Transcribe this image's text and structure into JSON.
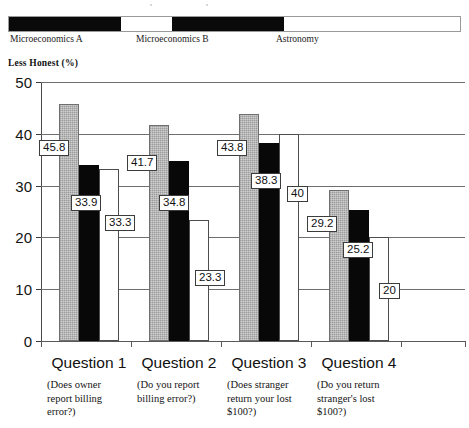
{
  "legend": {
    "items": [
      {
        "label": "Microeconomics A",
        "color": "#0a0a0a",
        "swatch_left": 0,
        "swatch_width": 112,
        "label_left": 2
      },
      {
        "label": "Microeconomics B",
        "color": "#0a0a0a",
        "swatch_left": 163,
        "swatch_width": 112,
        "label_left": 128
      },
      {
        "label": "Astronomy",
        "color": "#ffffff",
        "swatch_left": 275,
        "swatch_width": 0,
        "label_left": 268
      }
    ]
  },
  "axis_title": "Less Honest (%)",
  "chart_data": {
    "type": "bar",
    "title": "",
    "xlabel": "",
    "ylabel": "Less Honest (%)",
    "ylim": [
      0,
      50
    ],
    "yticks": [
      0,
      10,
      20,
      30,
      40,
      50
    ],
    "ytick_labels": [
      "0",
      "10",
      "20",
      "30",
      "40",
      "50"
    ],
    "grid": true,
    "legend_position": "top",
    "categories": [
      "Question 1",
      "Question 2",
      "Question 3",
      "Question 4"
    ],
    "category_sublabels": [
      "(Does owner report billing error?)",
      "(Do you report billing error?)",
      "(Does stranger return your lost $100?)",
      "(Do you return stranger's lost $100?)"
    ],
    "series": [
      {
        "name": "Microeconomics A",
        "color": "#adadad",
        "values": [
          45.8,
          41.7,
          43.8,
          29.2
        ],
        "labels": [
          "45.8",
          "41.7",
          "43.8",
          "29.2"
        ]
      },
      {
        "name": "Microeconomics B",
        "color": "#080808",
        "values": [
          33.9,
          34.8,
          38.3,
          25.2
        ],
        "labels": [
          "33.9",
          "34.8",
          "38.3",
          "25.2"
        ]
      },
      {
        "name": "Astronomy",
        "color": "#ffffff",
        "values": [
          33.3,
          23.3,
          40,
          20
        ],
        "labels": [
          "33.3",
          "23.3",
          "40",
          "20"
        ]
      }
    ]
  },
  "sublabel_lines": [
    [
      "(Does owner",
      "report billing",
      "error?)"
    ],
    [
      "(Do you report",
      "billing error?)"
    ],
    [
      "(Does stranger",
      "return your lost",
      "$100?)"
    ],
    [
      "(Do you return",
      "stranger's lost",
      "$100?)"
    ]
  ]
}
